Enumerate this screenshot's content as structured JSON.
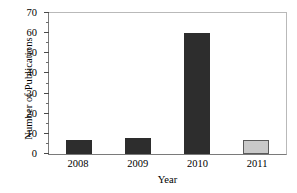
{
  "chart_data": {
    "type": "bar",
    "title": "",
    "xlabel": "Year",
    "ylabel": "Number of Publications",
    "categories": [
      "2008",
      "2009",
      "2010",
      "2011"
    ],
    "values": [
      7,
      8,
      60,
      7
    ],
    "ylim": [
      0,
      70
    ],
    "ytick_labels": [
      "0",
      "10",
      "20",
      "30",
      "40",
      "50",
      "60",
      "70"
    ],
    "ytick_values": [
      0,
      10,
      20,
      30,
      40,
      50,
      60,
      70
    ],
    "ytick_minor_values": [
      5,
      15,
      25,
      35,
      45,
      55,
      65
    ],
    "grid": false,
    "legend": "none",
    "bar_colors": [
      "#2d2d2d",
      "#2d2d2d",
      "#2d2d2d",
      "#c9c9c9"
    ],
    "bar_edge_colors": [
      "#2d2d2d",
      "#2d2d2d",
      "#2d2d2d",
      "#5a5a5a"
    ],
    "frame_color": "#7a7a7a",
    "series": [
      {
        "name": "Number of Publications",
        "values": [
          7,
          8,
          60,
          7
        ]
      }
    ]
  }
}
